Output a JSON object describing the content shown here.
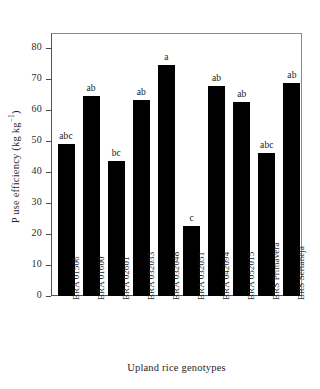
{
  "chart_data": {
    "type": "bar",
    "title": "",
    "xlabel": "Upland rice genotypes",
    "ylabel": "P use efficiency (kg kg⁻¹)",
    "ylabel_main": "P use efficiency (kg kg",
    "ylabel_exponent": "−1",
    "ylabel_tail": ")",
    "ylim": [
      0,
      85
    ],
    "ytick_values": [
      0,
      10,
      20,
      30,
      40,
      50,
      60,
      70,
      80
    ],
    "ytick_labels": [
      "0",
      "10",
      "20",
      "30",
      "40",
      "50",
      "60",
      "70",
      "80"
    ],
    "grid": false,
    "legend": null,
    "bar_color": "#000000",
    "categories": [
      "BRA 01506",
      "BRA 01600",
      "BRA 02601",
      "BRA 032033",
      "BRA 032048",
      "BRA 032051",
      "BRA 042094",
      "BRA 052015",
      "BRS Primavera",
      "BRS Sertaneja"
    ],
    "values": [
      49.2,
      64.7,
      43.6,
      63.2,
      74.8,
      22.7,
      67.8,
      62.6,
      46.2,
      68.7
    ],
    "annotations": [
      "abc",
      "ab",
      "bc",
      "ab",
      "a",
      "c",
      "ab",
      "ab",
      "abc",
      "ab"
    ]
  }
}
